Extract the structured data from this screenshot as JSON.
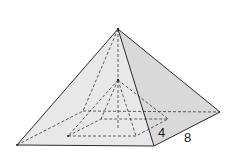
{
  "diagram": {
    "labels": [
      {
        "id": "inner-dimension",
        "text": "4",
        "x": 158,
        "y": 137
      },
      {
        "id": "outer-dimension",
        "text": "8",
        "x": 184,
        "y": 142
      }
    ],
    "colors": {
      "front_face": "#e8e8e8",
      "right_face": "#d9d9d9",
      "edge": "#2a2a2a",
      "hidden_edge": "#3a3a3a",
      "background": "#ffffff"
    }
  }
}
